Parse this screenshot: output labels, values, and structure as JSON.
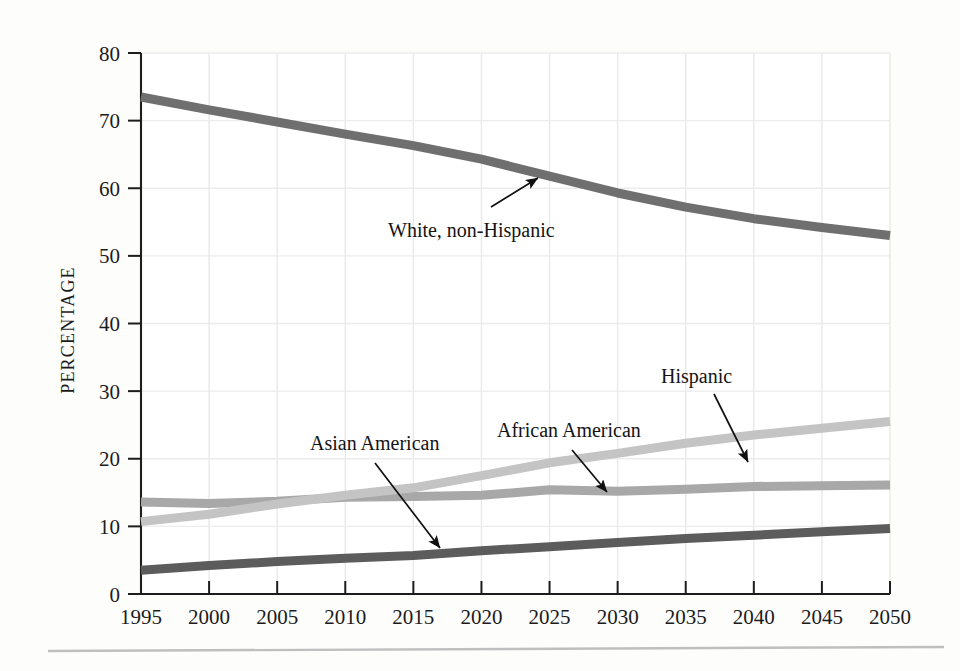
{
  "chart_data": {
    "type": "line",
    "title": "",
    "subtitle": "",
    "xlabel": "",
    "ylabel": "PERCENTAGE",
    "x": [
      1995,
      2000,
      2005,
      2010,
      2015,
      2020,
      2025,
      2030,
      2035,
      2040,
      2045,
      2050
    ],
    "xlim": [
      1995,
      2050
    ],
    "ylim": [
      0,
      80
    ],
    "x_ticks": [
      "1995",
      "2000",
      "2005",
      "2010",
      "2015",
      "2020",
      "2025",
      "2030",
      "2035",
      "2040",
      "2045",
      "2050"
    ],
    "y_ticks": [
      "0",
      "10",
      "20",
      "30",
      "40",
      "50",
      "60",
      "70",
      "80"
    ],
    "grid": true,
    "legend_position": "inline-annotations",
    "series": [
      {
        "name": "White, non-Hispanic",
        "color": "#6f6f6f",
        "values": [
          73.5,
          71.6,
          69.8,
          68.0,
          66.3,
          64.3,
          61.8,
          59.3,
          57.2,
          55.5,
          54.2,
          53.0
        ]
      },
      {
        "name": "African American",
        "color": "#a8a8a8",
        "values": [
          13.6,
          13.4,
          13.7,
          14.3,
          14.4,
          14.6,
          15.4,
          15.2,
          15.5,
          15.9,
          16.0,
          16.1
        ]
      },
      {
        "name": "Hispanic",
        "color": "#c4c4c4",
        "values": [
          10.7,
          11.8,
          13.3,
          14.6,
          15.7,
          17.5,
          19.4,
          20.8,
          22.3,
          23.5,
          24.5,
          25.5
        ]
      },
      {
        "name": "Asian American",
        "color": "#5c5c5c",
        "values": [
          3.5,
          4.2,
          4.8,
          5.3,
          5.7,
          6.4,
          7.0,
          7.6,
          8.2,
          8.7,
          9.2,
          9.7
        ]
      }
    ],
    "annotations": [
      {
        "text": "White, non-Hispanic",
        "series": "White, non-Hispanic"
      },
      {
        "text": "Asian American",
        "series": "Asian American"
      },
      {
        "text": "African American",
        "series": "African American"
      },
      {
        "text": "Hispanic",
        "series": "Hispanic"
      }
    ],
    "colors": {
      "white_non_hispanic": "#6f6f6f",
      "african_american": "#a8a8a8",
      "hispanic": "#c4c4c4",
      "asian_american": "#5c5c5c",
      "axis": "#1d1d1d",
      "grid": "#e8e8e8",
      "background": "#fdfdfc"
    }
  }
}
